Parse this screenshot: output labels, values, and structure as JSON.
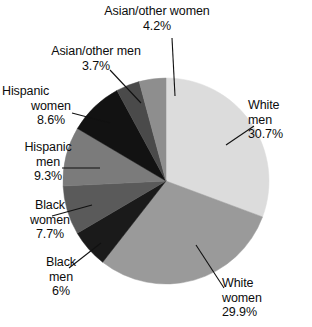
{
  "chart_data": {
    "type": "pie",
    "title": "",
    "start_angle_deg": 0,
    "direction": "clockwise",
    "legend": "none",
    "labels_outside": true,
    "categories": [
      "White men",
      "White women",
      "Black men",
      "Black women",
      "Hispanic men",
      "Hispanic women",
      "Asian/other men",
      "Asian/other women"
    ],
    "values": [
      30.7,
      29.9,
      6,
      7.7,
      9.3,
      8.6,
      3.7,
      4.2
    ],
    "value_labels": [
      "30.7%",
      "29.9%",
      "6%",
      "7.7%",
      "9.3%",
      "8.6%",
      "3.7%",
      "4.2%"
    ],
    "colors": [
      "#dcdcdc",
      "#9a9a9a",
      "#1a1a1a",
      "#5a5a5a",
      "#7b7b7b",
      "#121212",
      "#4a4a4a",
      "#8e8e8e"
    ],
    "slices": [
      {
        "name": "White men",
        "label_lines": [
          "White",
          "men",
          "30.7%"
        ],
        "value": 30.7,
        "value_label": "30.7%",
        "color": "#dcdcdc"
      },
      {
        "name": "White women",
        "label_lines": [
          "White",
          "women",
          "29.9%"
        ],
        "value": 29.9,
        "value_label": "29.9%",
        "color": "#9a9a9a"
      },
      {
        "name": "Black men",
        "label_lines": [
          "Black",
          "men",
          "6%"
        ],
        "value": 6,
        "value_label": "6%",
        "color": "#1a1a1a"
      },
      {
        "name": "Black women",
        "label_lines": [
          "Black",
          "women",
          "7.7%"
        ],
        "value": 7.7,
        "value_label": "7.7%",
        "color": "#5a5a5a"
      },
      {
        "name": "Hispanic men",
        "label_lines": [
          "Hispanic",
          "men",
          "9.3%"
        ],
        "value": 9.3,
        "value_label": "9.3%",
        "color": "#7b7b7b"
      },
      {
        "name": "Hispanic women",
        "label_lines": [
          "Hispanic",
          "women",
          "8.6%"
        ],
        "value": 8.6,
        "value_label": "8.6%",
        "color": "#121212"
      },
      {
        "name": "Asian/other men",
        "label_lines": [
          "Asian/other men",
          "3.7%"
        ],
        "value": 3.7,
        "value_label": "3.7%",
        "color": "#4a4a4a"
      },
      {
        "name": "Asian/other women",
        "label_lines": [
          "Asian/other women",
          "4.2%"
        ],
        "value": 4.2,
        "value_label": "4.2%",
        "color": "#8e8e8e"
      }
    ],
    "geometry": {
      "center_x": 166,
      "center_y": 181,
      "radius": 103
    }
  },
  "labels": {
    "asian_other_women": {
      "l1": "Asian/other women",
      "l2": "4.2%"
    },
    "asian_other_men": {
      "l1": "Asian/other men",
      "l2": "3.7%"
    },
    "hispanic_women": {
      "l1": "Hispanic",
      "l2": "women",
      "l3": "8.6%"
    },
    "hispanic_men": {
      "l1": "Hispanic",
      "l2": "men",
      "l3": "9.3%"
    },
    "black_women": {
      "l1": "Black",
      "l2": "women",
      "l3": "7.7%"
    },
    "black_men": {
      "l1": "Black",
      "l2": "men",
      "l3": "6%"
    },
    "white_men": {
      "l1": "White",
      "l2": "men",
      "l3": "30.7%"
    },
    "white_women": {
      "l1": "White",
      "l2": "women",
      "l3": "29.9%"
    }
  }
}
